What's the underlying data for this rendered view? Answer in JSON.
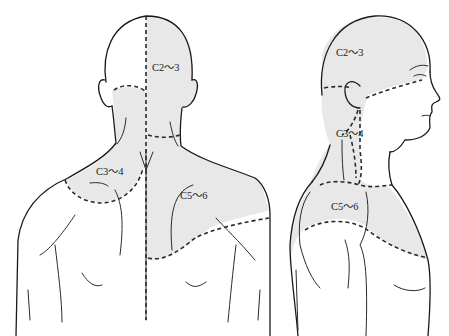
{
  "figure": {
    "colors": {
      "shade": "#e8e8e8",
      "line": "#1a1a1a",
      "background": "#ffffff"
    },
    "views": [
      {
        "name": "posterior-view",
        "labels": [
          {
            "id": "c2-3",
            "text": "C2～3"
          },
          {
            "id": "c3-4",
            "text": "C3～4"
          },
          {
            "id": "c5-6",
            "text": "C5～6"
          }
        ]
      },
      {
        "name": "lateral-view",
        "labels": [
          {
            "id": "c2-3",
            "text": "C2～3"
          },
          {
            "id": "c3-4",
            "text": "C3～4"
          },
          {
            "id": "c5-6",
            "text": "C5～6"
          }
        ]
      }
    ]
  }
}
